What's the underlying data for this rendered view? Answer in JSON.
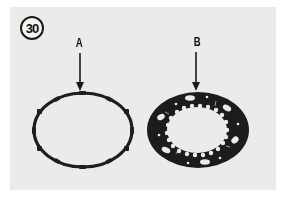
{
  "figure": {
    "number": "30",
    "background_color": "#ebebea",
    "ink_color": "#1a1a1a"
  },
  "callouts": [
    {
      "id": "A",
      "label": "A",
      "part": "thin-ring-with-outer-tabs"
    },
    {
      "id": "B",
      "label": "B",
      "part": "wide-plate-with-inner-teeth-and-holes"
    }
  ],
  "icons": {
    "arrow_a": "arrow-down-icon",
    "arrow_b": "arrow-down-icon"
  }
}
